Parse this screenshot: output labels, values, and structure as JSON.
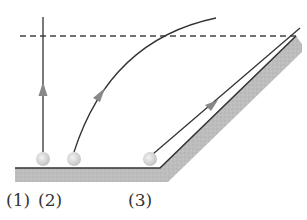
{
  "diagram": {
    "labels": [
      {
        "id": "1",
        "text": "(1)"
      },
      {
        "id": "2",
        "text": "(2)"
      },
      {
        "id": "3",
        "text": "(3)"
      }
    ],
    "colors": {
      "line": "#333333",
      "ground_fill": "#b8b8b8",
      "ball": "#d9d9d9",
      "arrow": "#888888",
      "dashed": "#444444"
    }
  }
}
